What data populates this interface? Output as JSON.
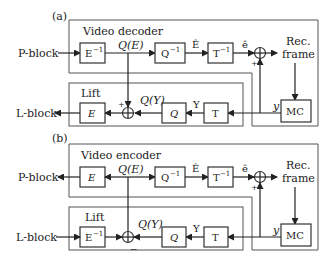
{
  "panels": [
    {
      "id": "a",
      "panel_label": "(a)",
      "section_title": "Video decoder",
      "lift_title": "Lift",
      "input_label": "P-block",
      "output_label": "L-block",
      "blocks": {
        "first": "E",
        "first_sup": "−1",
        "quant_inv": "Q",
        "quant_inv_sup": "−1",
        "transform_inv": "T",
        "transform_inv_sup": "−1",
        "lift_e": "E",
        "lift_q": "Q",
        "lift_t": "T",
        "mc": "MC"
      },
      "signals": {
        "qe": "Q(E)",
        "ehat": "Ê",
        "e_small": "ê",
        "qy": "Q(Y)",
        "y_upper": "Y",
        "y_lower": "y",
        "plus1": "+",
        "plus2": "+",
        "plus3": "+"
      },
      "rec_frame": [
        "Rec.",
        "frame"
      ]
    },
    {
      "id": "b",
      "panel_label": "(b)",
      "section_title": "Video encoder",
      "lift_title": "Lift",
      "input_label": "L-block",
      "output_label": "P-block",
      "blocks": {
        "first": "E",
        "quant_inv": "Q",
        "quant_inv_sup": "−1",
        "transform_inv": "T",
        "transform_inv_sup": "−1",
        "lift_e": "E",
        "lift_e_sup": "−1",
        "lift_q": "Q",
        "lift_t": "T",
        "mc": "MC"
      },
      "signals": {
        "qe": "Q(E)",
        "ehat": "Ê",
        "e_small": "ê",
        "qy": "Q(Y)",
        "y_upper": "Y",
        "y_lower": "y",
        "plus": "+",
        "minus": "−"
      },
      "rec_frame": [
        "Rec.",
        "frame"
      ]
    }
  ]
}
